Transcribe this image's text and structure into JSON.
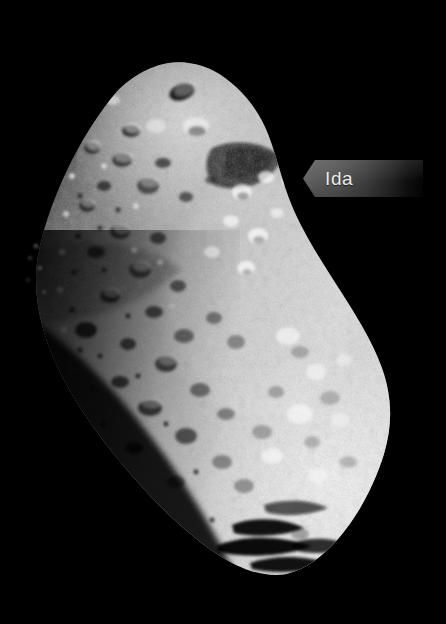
{
  "image": {
    "subject": "Ida",
    "kind": "asteroid-photograph",
    "background_color": "#000000",
    "width": 446,
    "height": 624
  },
  "callout": {
    "label": "Ida",
    "text_color": "#ebebeb",
    "plate_color_left": "#636363",
    "plate_color_right": "#050505",
    "arrow_direction": "left"
  },
  "asteroid": {
    "name": "Ida",
    "surface_color_bright": "#e8e8e8",
    "surface_color_mid": "#9a9a9a",
    "surface_color_dark": "#2a2a2a",
    "terminator_side": "left",
    "illumination_side": "right"
  }
}
